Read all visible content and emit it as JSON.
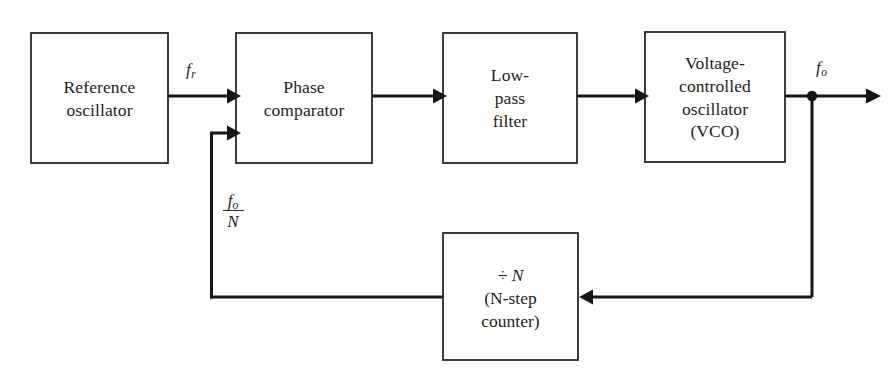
{
  "diagram": {
    "line_color": "#161616",
    "box_fill": "#ffffff",
    "background": "#fefefe",
    "blocks": [
      {
        "id": "reference-oscillator",
        "lines": [
          "Reference",
          "oscillator"
        ],
        "x": 31,
        "y": 33,
        "w": 137,
        "h": 130
      },
      {
        "id": "phase-comparator",
        "lines": [
          "Phase",
          "comparator"
        ],
        "x": 236,
        "y": 33,
        "w": 136,
        "h": 130
      },
      {
        "id": "low-pass-filter",
        "lines": [
          "Low-",
          "pass",
          "filter"
        ],
        "x": 443,
        "y": 33,
        "w": 134,
        "h": 130
      },
      {
        "id": "voltage-controlled-oscillator",
        "lines": [
          "Voltage-",
          "controlled",
          "oscillator",
          "(VCO)"
        ],
        "x": 645,
        "y": 32,
        "w": 140,
        "h": 130
      },
      {
        "id": "divide-by-n-counter",
        "lines": [
          "÷ N",
          "(N-step",
          "counter)"
        ],
        "x": 443,
        "y": 233,
        "w": 135,
        "h": 127
      }
    ],
    "signals": {
      "reference_frequency": {
        "base": "f",
        "sub": "r"
      },
      "output_frequency": {
        "base": "f",
        "sub": "o"
      },
      "feedback_fraction": {
        "numerator_base": "f",
        "numerator_sub": "o",
        "denominator": "N"
      }
    }
  }
}
